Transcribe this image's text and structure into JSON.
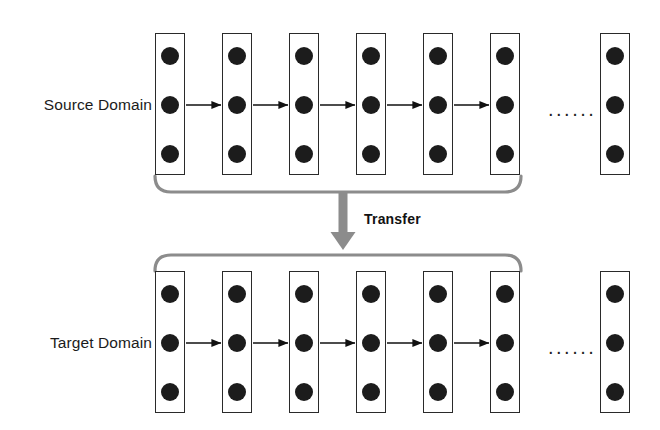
{
  "diagram": {
    "type": "flow-diagram",
    "background_color": "#ffffff",
    "rows": [
      {
        "id": "source",
        "label": "Source Domain",
        "label_x": 0,
        "label_y": 96,
        "column_top": 33,
        "ellipsis": "......",
        "ellipsis_x": 548,
        "ellipsis_y": 99,
        "columns": [
          {
            "x": 155,
            "nodes": 3
          },
          {
            "x": 222,
            "nodes": 3
          },
          {
            "x": 289,
            "nodes": 3
          },
          {
            "x": 356,
            "nodes": 3
          },
          {
            "x": 423,
            "nodes": 3
          },
          {
            "x": 490,
            "nodes": 3
          },
          {
            "x": 600,
            "nodes": 3
          }
        ],
        "arrows": [
          {
            "x1": 186,
            "x2": 221,
            "y": 105
          },
          {
            "x1": 253,
            "x2": 288,
            "y": 105
          },
          {
            "x1": 320,
            "x2": 355,
            "y": 105
          },
          {
            "x1": 387,
            "x2": 422,
            "y": 105
          },
          {
            "x1": 454,
            "x2": 489,
            "y": 105
          }
        ],
        "bracket": {
          "orientation": "down",
          "left_x": 155,
          "right_x": 521,
          "top_y": 176,
          "bottom_y": 192
        }
      },
      {
        "id": "target",
        "label": "Target Domain",
        "label_x": 0,
        "label_y": 334,
        "column_top": 271,
        "ellipsis": "......",
        "ellipsis_x": 548,
        "ellipsis_y": 337,
        "columns": [
          {
            "x": 155,
            "nodes": 3
          },
          {
            "x": 222,
            "nodes": 3
          },
          {
            "x": 289,
            "nodes": 3
          },
          {
            "x": 356,
            "nodes": 3
          },
          {
            "x": 423,
            "nodes": 3
          },
          {
            "x": 490,
            "nodes": 3
          },
          {
            "x": 600,
            "nodes": 3
          }
        ],
        "arrows": [
          {
            "x1": 186,
            "x2": 221,
            "y": 343
          },
          {
            "x1": 253,
            "x2": 288,
            "y": 343
          },
          {
            "x1": 320,
            "x2": 355,
            "y": 343
          },
          {
            "x1": 387,
            "x2": 422,
            "y": 343
          },
          {
            "x1": 454,
            "x2": 489,
            "y": 343
          }
        ],
        "bracket": {
          "orientation": "up",
          "left_x": 155,
          "right_x": 521,
          "top_y": 255,
          "bottom_y": 271
        }
      }
    ],
    "transfer": {
      "label": "Transfer",
      "label_x": 364,
      "label_y": 211,
      "arrow_color": "#8c8c8c",
      "arrow_x": 343,
      "arrow_top": 191,
      "arrow_tip": 250,
      "shaft_width": 9,
      "head_width": 25,
      "head_height": 18
    },
    "style": {
      "node_color": "#1c1c1c",
      "node_diameter": 18,
      "column_border_color": "#2a2a2a",
      "column_width": 30,
      "column_height": 142,
      "arrow_color": "#111111",
      "bracket_color": "#8c8c8c",
      "bracket_width": 3.2,
      "text_color": "#1b1b1b"
    }
  }
}
